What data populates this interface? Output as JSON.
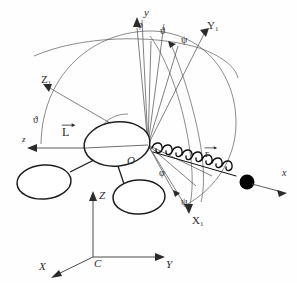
{
  "figure": {
    "kind": "mechanics-diagram",
    "stroke_color": "#2b2b2b",
    "thin_stroke_color": "#5a5a5a",
    "mass_color": "#000000",
    "background": "#fefefe"
  },
  "labels": {
    "y_axis": "y",
    "phi_top": "φ",
    "theta_top": "ϑ",
    "psi_top": "ψ",
    "Y1_axis": "Y",
    "Y1_sub": "1",
    "Z1_axis": "Z",
    "Z1_sub": "1",
    "theta_left": "ϑ",
    "z_axis": "z",
    "L_vector": "L",
    "origin_O": "O",
    "phi_lower": "φ",
    "psi_lower": "ψ",
    "X1_axis": "X",
    "X1_sub": "1",
    "r_vector": "r",
    "x_axis": "x",
    "Z_fixed": "Z",
    "Y_fixed": "Y",
    "X_fixed": "X",
    "C_origin": "C"
  },
  "geometry": {
    "origin_O": [
      148,
      145
    ],
    "mass_point": [
      247,
      182
    ],
    "fixed_frame_origin": [
      93,
      257
    ],
    "spring_coils": 14
  }
}
